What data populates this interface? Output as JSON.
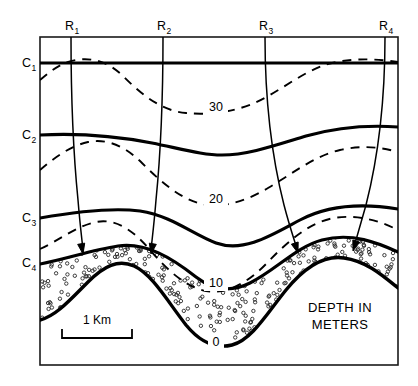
{
  "figure": {
    "kind": "geological-cross-section",
    "background_color": "#ffffff",
    "line_color": "#000000",
    "frame": {
      "x": 40,
      "y": 37,
      "width": 358,
      "height": 328
    }
  },
  "legend": {
    "depth_caption_line1": "DEPTH IN",
    "depth_caption_line2": "METERS",
    "scale_label": "1 Km"
  },
  "ray_labels": [
    {
      "id": "R1",
      "base": "R",
      "sub": "1",
      "x": 71,
      "y": 30
    },
    {
      "id": "R2",
      "base": "R",
      "sub": "2",
      "x": 163,
      "y": 30
    },
    {
      "id": "R3",
      "base": "R",
      "sub": "3",
      "x": 265,
      "y": 30
    },
    {
      "id": "R4",
      "base": "R",
      "sub": "4",
      "x": 385,
      "y": 30
    }
  ],
  "horizon_labels": [
    {
      "id": "C1",
      "base": "C",
      "sub": "1",
      "x": 22,
      "y": 67
    },
    {
      "id": "C2",
      "base": "C",
      "sub": "2",
      "x": 22,
      "y": 139
    },
    {
      "id": "C3",
      "base": "C",
      "sub": "3",
      "x": 22,
      "y": 222
    },
    {
      "id": "C4",
      "base": "C",
      "sub": "4",
      "x": 22,
      "y": 267
    }
  ],
  "contour_labels": [
    {
      "value": "30",
      "x": 216,
      "y": 111
    },
    {
      "value": "20",
      "x": 216,
      "y": 203
    },
    {
      "value": "10",
      "x": 216,
      "y": 287
    },
    {
      "value": "0",
      "x": 216,
      "y": 346
    }
  ],
  "chart_data": {
    "type": "line",
    "title": "",
    "xlabel": "",
    "ylabel": "",
    "solid_horizons": [
      {
        "name": "C1",
        "path": "M 40 63 L 398 63"
      },
      {
        "name": "C2",
        "path": "M 40 135 C 78 133 116 136 152 143 C 186 150 204 155 222 155 C 248 155 276 145 306 136 C 338 127 370 125 398 127"
      },
      {
        "name": "C3",
        "path": "M 40 218 C 74 212 110 207 140 211 C 172 216 192 234 216 243 C 244 253 272 235 300 220 C 332 203 368 204 398 209"
      },
      {
        "name": "C4",
        "path": "M 40 264 C 66 259 92 250 118 246 C 146 242 172 258 196 277 C 214 291 232 292 250 283 C 276 270 296 247 322 240 C 352 232 378 243 398 252"
      }
    ],
    "basement_surface": {
      "name": "zero-meter-surface",
      "path": "M 40 320 C 56 316 70 300 88 282 C 104 266 118 259 134 266 C 152 274 168 302 186 325 C 200 342 216 349 232 345 C 252 340 268 312 286 290 C 304 268 324 255 344 258 C 366 261 382 275 398 288"
    },
    "dashed_contours": [
      {
        "value": 30,
        "path": "M 40 80 C 52 70 62 62 76 60 C 94 57 110 63 124 77 C 142 95 162 111 186 113 C 206 115 230 113 252 104 C 276 94 298 75 322 66 C 344 58 372 58 398 62"
      },
      {
        "value": 20,
        "path": "M 40 170 C 54 158 70 146 88 142 C 108 138 126 147 142 163 C 160 181 180 199 202 204 C 224 209 248 200 268 188 C 292 174 314 156 340 150 C 362 145 380 147 398 152"
      },
      {
        "value": 10,
        "path": "M 40 249 C 58 241 76 226 96 222 C 116 218 134 231 150 250 C 168 271 186 287 206 291 C 228 295 250 281 268 262 C 288 241 310 222 334 218 C 358 214 380 221 398 230"
      }
    ],
    "raypaths": [
      {
        "name": "R1",
        "path": "M 71 37 C 71 90 73 150 78 200 C 80 225 82 240 83 250",
        "arrow_tip": [
          83,
          254
        ],
        "arrow_angle": 80
      },
      {
        "name": "R2",
        "path": "M 163 37 C 163 90 161 150 156 200 C 154 225 152 240 151 250",
        "arrow_tip": [
          151,
          254
        ],
        "arrow_angle": 100
      },
      {
        "name": "R3",
        "path": "M 265 37 C 265 90 270 150 284 205 C 290 228 295 242 297 249",
        "arrow_tip": [
          298,
          253
        ],
        "arrow_angle": 72
      },
      {
        "name": "R4",
        "path": "M 385 37 C 385 90 380 150 366 205 C 360 226 356 240 354 247",
        "arrow_tip": [
          353,
          251
        ],
        "arrow_angle": 108
      }
    ],
    "stipple_band": {
      "outer_path": "M 40 320 C 56 316 70 300 88 282 C 104 266 118 259 134 266 C 152 274 168 302 186 325 C 200 342 216 349 232 345 C 252 340 268 312 286 290 C 304 268 324 255 344 258 C 366 261 382 275 398 288",
      "inner_path": "M 40 264 C 66 259 92 250 118 246 C 146 242 172 258 196 277 C 214 291 232 292 250 283 C 276 270 296 247 322 240 C 352 232 378 243 398 252",
      "dot_radius": 1.7,
      "dot_count": 250
    },
    "scale_bar": {
      "x1": 62,
      "x2": 132,
      "y": 338,
      "tick_height": 9
    }
  }
}
